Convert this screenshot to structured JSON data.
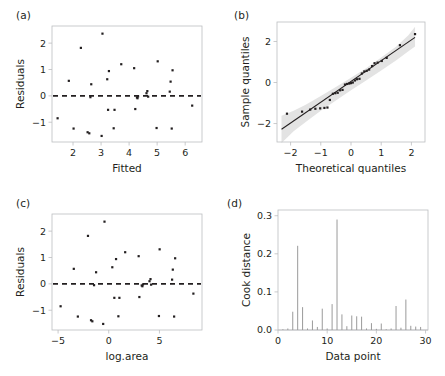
{
  "figure": {
    "panels": [
      {
        "id": "a",
        "label": "(a)"
      },
      {
        "id": "b",
        "label": "(b)"
      },
      {
        "id": "c",
        "label": "(c)"
      },
      {
        "id": "d",
        "label": "(d)"
      }
    ]
  },
  "chart_data": [
    {
      "id": "a",
      "type": "scatter",
      "title": "(a)",
      "xlabel": "Fitted",
      "ylabel": "Residuals",
      "xlim": [
        1.25,
        6.6
      ],
      "ylim": [
        -1.75,
        2.65
      ],
      "xticks": [
        2,
        3,
        4,
        5,
        6
      ],
      "yticks": [
        -1,
        0,
        1,
        2
      ],
      "grid": false,
      "legend": null,
      "reference_line": {
        "type": "horizontal",
        "y": 0,
        "style": "dashed"
      },
      "x": [
        1.45,
        1.85,
        2.02,
        2.28,
        2.52,
        2.58,
        2.62,
        2.65,
        3.02,
        3.05,
        3.22,
        3.25,
        3.28,
        3.45,
        3.48,
        3.72,
        4.18,
        4.22,
        4.28,
        4.3,
        4.32,
        4.62,
        4.65,
        4.68,
        4.98,
        5.02,
        5.45,
        5.48,
        5.52,
        5.55,
        6.25
      ],
      "y": [
        -0.85,
        0.57,
        -1.24,
        1.82,
        -1.38,
        -1.42,
        -0.05,
        0.44,
        -1.52,
        2.36,
        0.63,
        -0.53,
        0.94,
        -1.23,
        -0.53,
        1.2,
        1.05,
        -0.5,
        -0.06,
        -0.09,
        -0.02,
        0.1,
        0.18,
        -0.03,
        -1.22,
        1.31,
        0.16,
        0.54,
        -1.24,
        0.97,
        -0.37
      ]
    },
    {
      "id": "b",
      "type": "scatter",
      "title": "(b)",
      "xlabel": "Theoretical quantiles",
      "ylabel": "Sample quantiles",
      "xlim": [
        -2.45,
        2.45
      ],
      "ylim": [
        -2.9,
        2.95
      ],
      "xticks": [
        -2,
        -1,
        0,
        1,
        2
      ],
      "yticks": [
        -2,
        0,
        2
      ],
      "grid": false,
      "legend": null,
      "fit_line": {
        "x": [
          -2.3,
          2.12
        ],
        "y": [
          -2.28,
          2.2
        ]
      },
      "confidence_band": {
        "x": [
          -2.3,
          -1.9,
          -1.5,
          -1.0,
          -0.5,
          0.0,
          0.5,
          1.0,
          1.5,
          1.9,
          2.12
        ],
        "upper": [
          -1.62,
          -1.38,
          -1.08,
          -0.66,
          -0.22,
          0.23,
          0.7,
          1.22,
          1.76,
          2.3,
          2.72
        ],
        "lower": [
          -2.95,
          -2.38,
          -1.92,
          -1.38,
          -0.88,
          -0.38,
          0.1,
          0.58,
          1.08,
          1.52,
          1.76
        ]
      },
      "x": [
        -2.12,
        -1.62,
        -1.35,
        -1.18,
        -1.02,
        -0.88,
        -0.78,
        -0.7,
        -0.6,
        -0.52,
        -0.44,
        -0.36,
        -0.28,
        -0.2,
        -0.13,
        -0.06,
        0.0,
        0.06,
        0.13,
        0.2,
        0.28,
        0.36,
        0.44,
        0.52,
        0.6,
        0.7,
        0.78,
        0.88,
        1.02,
        1.18,
        1.62,
        2.12
      ],
      "y": [
        -1.52,
        -1.42,
        -1.32,
        -1.28,
        -1.26,
        -1.24,
        -1.22,
        -0.85,
        -0.55,
        -0.52,
        -0.5,
        -0.38,
        -0.36,
        -0.1,
        -0.07,
        -0.05,
        -0.03,
        0.0,
        0.1,
        0.16,
        0.18,
        0.44,
        0.54,
        0.57,
        0.63,
        0.8,
        0.94,
        0.97,
        1.05,
        1.2,
        1.82,
        2.36
      ]
    },
    {
      "id": "c",
      "type": "scatter",
      "title": "(c)",
      "xlabel": "log.area",
      "ylabel": "Residuals",
      "xlim": [
        -5.6,
        9.2
      ],
      "ylim": [
        -1.75,
        2.65
      ],
      "xticks": [
        -5,
        0,
        5
      ],
      "yticks": [
        -1,
        0,
        1,
        2
      ],
      "grid": false,
      "legend": null,
      "reference_line": {
        "type": "horizontal",
        "y": 0,
        "style": "dashed"
      },
      "x": [
        -4.75,
        -3.45,
        -3.05,
        -2.05,
        -1.75,
        -1.62,
        -1.45,
        -1.25,
        -0.55,
        -0.42,
        0.35,
        0.55,
        0.72,
        0.95,
        1.05,
        1.62,
        2.95,
        3.02,
        3.25,
        3.32,
        3.38,
        4.02,
        4.12,
        4.18,
        4.95,
        5.02,
        6.25,
        6.32,
        6.45,
        6.55,
        8.35
      ],
      "y": [
        -0.85,
        0.57,
        -1.24,
        1.82,
        -1.38,
        -1.42,
        -0.05,
        0.44,
        -1.52,
        2.36,
        0.63,
        -0.53,
        0.94,
        -1.23,
        -0.53,
        1.2,
        1.05,
        -0.5,
        -0.06,
        -0.09,
        -0.02,
        0.1,
        0.18,
        -0.03,
        -1.22,
        1.31,
        0.16,
        0.54,
        -1.24,
        0.97,
        -0.37
      ]
    },
    {
      "id": "d",
      "type": "bar",
      "title": "(d)",
      "xlabel": "Data point",
      "ylabel": "Cook distance",
      "xlim": [
        0,
        30.5
      ],
      "ylim": [
        0,
        0.315
      ],
      "xticks": [
        0,
        10,
        20,
        30
      ],
      "yticks": [
        0.0,
        0.1,
        0.2,
        0.3
      ],
      "ytick_labels": [
        "0.0",
        "0.1",
        "0.2",
        "0.3"
      ],
      "grid": false,
      "legend": null,
      "categories": [
        1,
        2,
        3,
        4,
        5,
        6,
        7,
        8,
        9,
        10,
        11,
        12,
        13,
        14,
        15,
        16,
        17,
        18,
        19,
        20,
        21,
        22,
        23,
        24,
        25,
        26,
        27,
        28,
        29
      ],
      "values": [
        0.002,
        0.004,
        0.048,
        0.221,
        0.06,
        0.004,
        0.025,
        0.008,
        0.056,
        0.004,
        0.068,
        0.29,
        0.041,
        0.01,
        0.038,
        0.036,
        0.035,
        0.004,
        0.018,
        0.003,
        0.017,
        0.002,
        0.004,
        0.063,
        0.006,
        0.08,
        0.011,
        0.009,
        0.008
      ]
    }
  ]
}
